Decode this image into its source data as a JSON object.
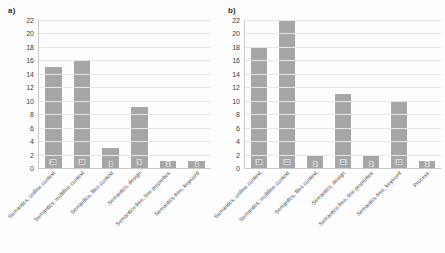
{
  "figure": {
    "panel_a_tag": "a)",
    "panel_b_tag": "b)",
    "bar_color": "#a6a6a6",
    "grid_color": "#e6e6e6",
    "axis_color": "#c9c9c9"
  },
  "chart_data": [
    {
      "type": "bar",
      "panel": "a)",
      "title": "",
      "xlabel": "",
      "ylabel": "",
      "ylim": [
        0,
        22
      ],
      "yticks": [
        0,
        2,
        4,
        6,
        8,
        10,
        12,
        14,
        16,
        18,
        20,
        22
      ],
      "grid": true,
      "legend": "none",
      "categories": [
        "Semantics, uniline context",
        "Semantics, multiline context",
        "Semantics, files context",
        "Semantics, design",
        "Semantics-free, line properties",
        "Semantics-free, keyword"
      ],
      "values": [
        15,
        16,
        3,
        9,
        1,
        1
      ],
      "data_labels": [
        "15",
        "16",
        "3",
        "9",
        "1",
        "1"
      ]
    },
    {
      "type": "bar",
      "panel": "b)",
      "title": "",
      "xlabel": "",
      "ylabel": "",
      "ylim": [
        0,
        22
      ],
      "yticks": [
        0,
        2,
        4,
        6,
        8,
        10,
        12,
        14,
        16,
        18,
        20,
        22
      ],
      "grid": true,
      "legend": "none",
      "categories": [
        "Semantics, uniline context",
        "Semantics, multiline context",
        "Semantics, files context",
        "Semantics, design",
        "Semantics-free, line properties",
        "Semantics-free, keyword",
        "Process"
      ],
      "values": [
        18,
        22,
        2,
        11,
        2,
        10,
        1
      ],
      "data_labels": [
        "18",
        "22",
        "2",
        "11",
        "2",
        "10",
        "1"
      ]
    }
  ]
}
